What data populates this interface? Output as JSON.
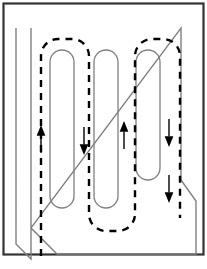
{
  "figure": {
    "width": 207,
    "height": 269,
    "background_color": "#ffffff"
  },
  "colors": {
    "frame_stroke": "#333333",
    "wall_stroke": "#808080",
    "obstacle_stroke": "#808080",
    "path_stroke": "#000000",
    "arrow_fill": "#000000",
    "canvas": "#ffffff"
  },
  "frame": {
    "name": "outer-border",
    "x": 3.5,
    "y": 3.5,
    "width": 200,
    "height": 251,
    "stroke_width": 2.2
  },
  "room": {
    "name": "room-boundary",
    "stroke_width": 1.4,
    "outline_points": "31,259 31,28 181,28 181,180 196,201 196,254 57,254 31,228 31,259",
    "segments": [
      {
        "name": "wall-left",
        "from": [
          31,
          28
        ],
        "to": [
          31,
          228
        ]
      },
      {
        "name": "wall-top",
        "from": [
          31,
          28
        ],
        "to": [
          181,
          28
        ]
      },
      {
        "name": "wall-right-upper",
        "from": [
          181,
          28
        ],
        "to": [
          181,
          180
        ]
      },
      {
        "name": "wall-right-bevel",
        "from": [
          181,
          180
        ],
        "to": [
          196,
          201
        ]
      },
      {
        "name": "wall-right-lower",
        "from": [
          196,
          201
        ],
        "to": [
          196,
          254
        ]
      },
      {
        "name": "wall-bottom",
        "from": [
          196,
          254
        ],
        "to": [
          57,
          254
        ]
      },
      {
        "name": "wall-bottom-left-bevel",
        "from": [
          57,
          254
        ],
        "to": [
          31,
          228
        ]
      },
      {
        "name": "wall-left-stub",
        "from": [
          31,
          228
        ],
        "to": [
          31,
          259
        ]
      },
      {
        "name": "wall-left-foot",
        "from": [
          31,
          259
        ],
        "to": [
          16,
          244
        ]
      },
      {
        "name": "wall-left-outer",
        "from": [
          16,
          244
        ],
        "to": [
          16,
          28
        ]
      }
    ]
  },
  "obstacles": [
    {
      "name": "obstacle-1",
      "x": 50,
      "y": 50,
      "width": 24,
      "height": 158,
      "radius": 12,
      "stroke_width": 1.3
    },
    {
      "name": "obstacle-2",
      "x": 94,
      "y": 50,
      "width": 24,
      "height": 158,
      "radius": 12,
      "stroke_width": 1.3
    },
    {
      "name": "obstacle-3",
      "x": 136,
      "y": 50,
      "width": 24,
      "height": 130,
      "radius": 12,
      "stroke_width": 1.3
    }
  ],
  "path": {
    "name": "coverage-path",
    "style": "dashed",
    "stroke_width": 2.4,
    "dash_pattern": "7,6",
    "d": "M 41 256 L 41 56 A 17 17 0 0 1 58 39 L 72 39 A 17 17 0 0 1 89 56 L 89 214 A 17 17 0 0 0 106 231 L 118 231 A 17 17 0 0 0 135 214 L 135 56 A 17 17 0 0 1 152 39 L 163 39 A 17 17 0 0 1 180 56 L 180 218",
    "direction": "counter-clockwise-boustrophedon"
  },
  "arrows": [
    {
      "name": "arrow-up-lane-1",
      "x": 41,
      "y": 132,
      "direction": "up",
      "size": 7
    },
    {
      "name": "arrow-down-lane-2",
      "x": 84,
      "y": 148,
      "direction": "down",
      "size": 7
    },
    {
      "name": "arrow-up-lane-3",
      "x": 124,
      "y": 128,
      "direction": "up",
      "size": 7
    },
    {
      "name": "arrow-down-lane-4",
      "x": 169,
      "y": 140,
      "direction": "down",
      "size": 7
    },
    {
      "name": "arrow-down-lane-4b",
      "x": 169,
      "y": 196,
      "direction": "down",
      "size": 7
    }
  ]
}
